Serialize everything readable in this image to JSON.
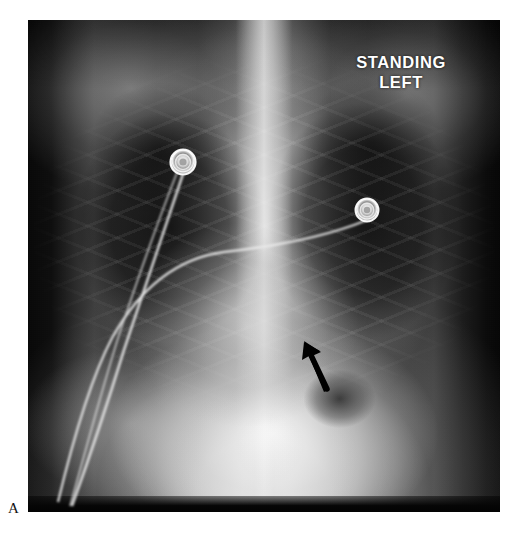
{
  "figure": {
    "panel_label": "A",
    "modality": "chest-radiograph",
    "view": "frontal-pa-upright",
    "background_color": "#ffffff",
    "plate_color": "#0a0a0a"
  },
  "radiograph": {
    "position_marker": {
      "line_1": "STANDING",
      "line_2": "LEFT",
      "color": "#ffffff"
    },
    "annotations": [
      {
        "name": "free-air-arrow",
        "kind": "arrow",
        "color": "#000000",
        "tip_x": 278,
        "tip_y": 325,
        "tail_x": 300,
        "tail_y": 368
      }
    ],
    "devices": [
      {
        "name": "ecg-electrode-right",
        "kind": "electrode",
        "cx": 155,
        "cy": 142,
        "outer_r": 12,
        "inner_r": 5,
        "color": "#f2f2f2"
      },
      {
        "name": "ecg-electrode-left",
        "kind": "electrode",
        "cx": 339,
        "cy": 190,
        "outer_r": 11,
        "inner_r": 4.5,
        "color": "#efefef"
      }
    ],
    "lead_wires": [
      "M155 154 C 140 200, 120 260, 96 330 C 80 382, 62 436, 44 486",
      "M339 200 C 300 216, 250 226, 196 232 C 150 238, 112 268, 84 318 C 62 360, 44 424, 30 482",
      "M150 150 C 132 196, 112 252, 92 312 C 74 368, 58 430, 42 486"
    ]
  },
  "colors": {
    "page_background": "#ffffff",
    "film_dark": "#070707",
    "film_bright": "#f0f0f0",
    "annotation_black": "#000000",
    "marker_white": "#ffffff"
  }
}
